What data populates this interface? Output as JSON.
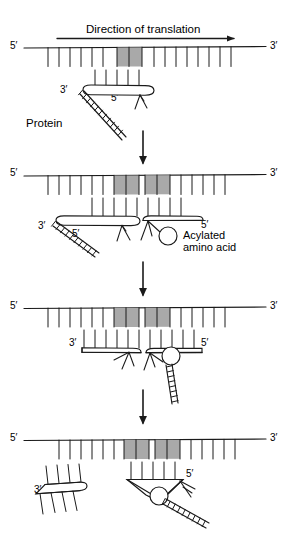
{
  "figure": {
    "title_caption": "",
    "type": "biology-diagram"
  },
  "labels": {
    "direction_of_translation": "Direction of translation",
    "protein": "Protein",
    "acylated_amino_acid_line1": "Acylated",
    "acylated_amino_acid_line2": "amino acid",
    "amino_acid_marker": "A",
    "five_prime": "5′",
    "three_prime": "3′"
  },
  "colors": {
    "stroke": "#1a1a1a",
    "codon_fill": "#a9a9a9",
    "codon_stroke": "#6e6e6e",
    "background": "#ffffff"
  },
  "panels": [
    {
      "id": "panel-1",
      "step": 1,
      "mrna": {
        "five_prime": "5′",
        "three_prime": "3′",
        "shaded_codons": 1
      },
      "trna": [
        {
          "id": "trna-peptidyl",
          "five_prime": "5′",
          "three_prime": "3′",
          "carries": "protein"
        }
      ],
      "annotations": [
        "Direction of translation",
        "Protein"
      ]
    },
    {
      "id": "panel-2",
      "step": 2,
      "mrna": {
        "five_prime": "5′",
        "three_prime": "3′",
        "shaded_codons": 2
      },
      "trna": [
        {
          "id": "trna-peptidyl",
          "five_prime": "5′",
          "three_prime": "3′",
          "carries": "protein"
        },
        {
          "id": "trna-aminoacyl",
          "five_prime": "5′",
          "three_prime": "",
          "carries": "acylated amino acid"
        }
      ],
      "annotations": [
        "Acylated amino acid"
      ]
    },
    {
      "id": "panel-3",
      "step": 3,
      "mrna": {
        "five_prime": "5′",
        "three_prime": "3′",
        "shaded_codons": 2
      },
      "trna": [
        {
          "id": "trna-deacylated",
          "five_prime": "5′",
          "three_prime": "3′",
          "carries": ""
        },
        {
          "id": "trna-peptidyl",
          "five_prime": "5′",
          "three_prime": "",
          "carries": "protein"
        }
      ],
      "annotations": []
    },
    {
      "id": "panel-4",
      "step": 4,
      "mrna": {
        "five_prime": "5′",
        "three_prime": "3′",
        "shaded_codons": 2
      },
      "trna": [
        {
          "id": "trna-released",
          "five_prime": "",
          "three_prime": "3′",
          "carries": ""
        },
        {
          "id": "trna-peptidyl",
          "five_prime": "5′",
          "three_prime": "",
          "carries": "protein"
        }
      ],
      "annotations": []
    }
  ],
  "arrows": [
    {
      "id": "direction-arrow",
      "orientation": "right",
      "label": "Direction of translation"
    },
    {
      "id": "step-arrow-1",
      "orientation": "down",
      "label": ""
    },
    {
      "id": "step-arrow-2",
      "orientation": "down",
      "label": ""
    },
    {
      "id": "step-arrow-3",
      "orientation": "down",
      "label": ""
    }
  ]
}
